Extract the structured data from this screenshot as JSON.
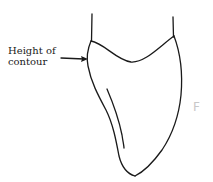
{
  "figure": {
    "annotation": {
      "line1": "Height of",
      "line2": "contour",
      "pointer": "arrow-right"
    },
    "faint_mark": "F",
    "stroke_color": "#1a1a1a",
    "background_color": "#ffffff"
  }
}
